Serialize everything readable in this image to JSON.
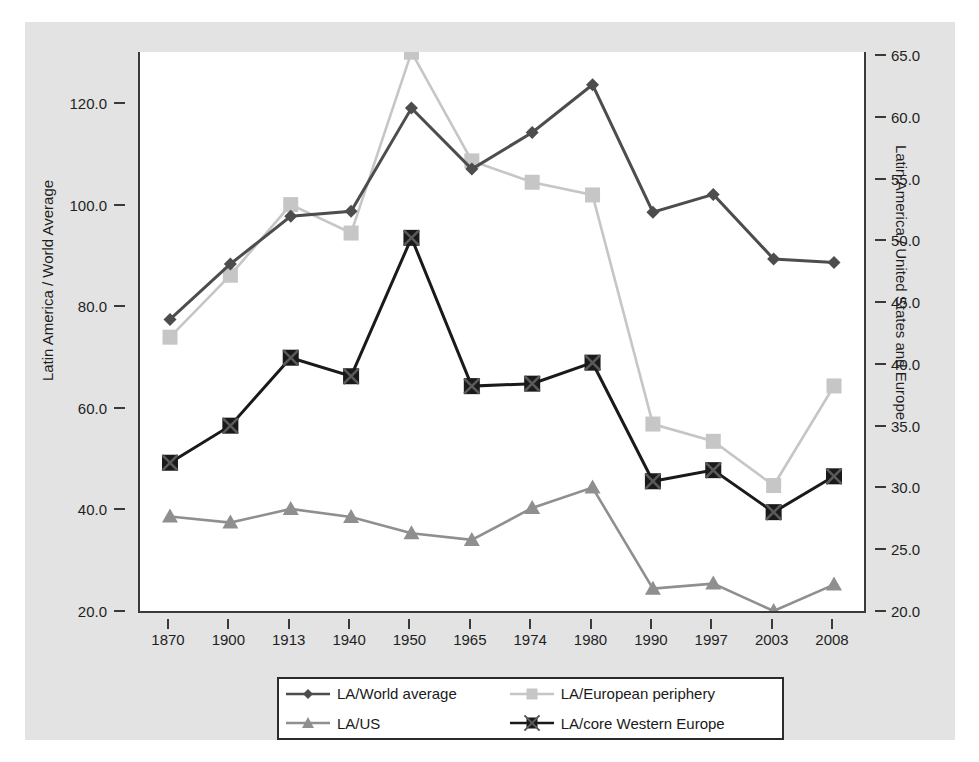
{
  "figure": {
    "background_color": "#e3e3e3",
    "plot_background_color": "#ffffff",
    "axis_color": "#3a3a3a"
  },
  "axes": {
    "left_title": "Latin America / World Average",
    "right_title": "Latin America / United States and Europe",
    "left_ticks": [
      "20.0",
      "40.0",
      "60.0",
      "80.0",
      "100.0",
      "120.0"
    ],
    "right_ticks": [
      "20.0",
      "25.0",
      "30.0",
      "35.0",
      "40.0",
      "45.0",
      "50.0",
      "55.0",
      "60.0",
      "65.0"
    ],
    "x_ticks": [
      "1870",
      "1900",
      "1913",
      "1940",
      "1950",
      "1965",
      "1974",
      "1980",
      "1990",
      "1997",
      "2003",
      "2008"
    ]
  },
  "legend": {
    "position": "below-axes",
    "entries": [
      {
        "label": "LA/World average",
        "color": "#4d4d4d",
        "marker": "diamond"
      },
      {
        "label": "LA/European periphery",
        "color": "#c6c6c6",
        "marker": "square"
      },
      {
        "label": "LA/US",
        "color": "#8f8f8f",
        "marker": "triangle"
      },
      {
        "label": "LA/core Western Europe",
        "color": "#1a1a1a",
        "marker": "x-square"
      }
    ]
  },
  "chart_data": {
    "type": "line",
    "title": "",
    "xlabel": "",
    "ylabel": "Latin America / World Average",
    "y2label": "Latin America / United States and Europe",
    "grid": false,
    "x": [
      "1870",
      "1900",
      "1913",
      "1940",
      "1950",
      "1965",
      "1974",
      "1980",
      "1990",
      "1997",
      "2003",
      "2008"
    ],
    "ylim": [
      20.0,
      125.0
    ],
    "y2lim": [
      20.0,
      65.0
    ],
    "series": [
      {
        "name": "LA/World average",
        "axis": "left",
        "color": "#4d4d4d",
        "marker": "diamond",
        "values": [
          77.4,
          88.3,
          97.7,
          98.7,
          119.0,
          107.0,
          114.2,
          123.6,
          98.5,
          102.0,
          89.3,
          88.6
        ]
      },
      {
        "name": "LA/European periphery",
        "axis": "left",
        "color": "#c6c6c6",
        "marker": "square",
        "values": [
          73.9,
          86.1,
          100.0,
          94.4,
          130.0,
          108.6,
          104.4,
          101.9,
          56.8,
          53.4,
          44.7,
          64.3
        ]
      },
      {
        "name": "LA/US",
        "axis": "left",
        "color": "#8f8f8f",
        "marker": "triangle",
        "values": [
          38.6,
          37.4,
          40.1,
          38.5,
          35.3,
          34.0,
          40.3,
          44.3,
          24.4,
          25.4,
          20.0,
          25.2
        ]
      },
      {
        "name": "LA/core Western Europe",
        "axis": "right",
        "color": "#1a1a1a",
        "marker": "x-square",
        "values": [
          32.0,
          35.0,
          40.5,
          39.0,
          50.2,
          38.2,
          38.4,
          40.1,
          30.5,
          31.4,
          28.0,
          30.9
        ]
      }
    ]
  }
}
